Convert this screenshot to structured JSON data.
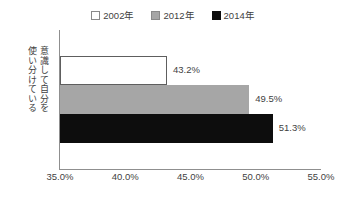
{
  "chart_data": {
    "type": "bar",
    "orientation": "horizontal",
    "title": "",
    "xlabel": "",
    "ylabel": "意識して自分を使い分けている",
    "categories": [
      "意識して自分を使い分けている"
    ],
    "series": [
      {
        "name": "2002年",
        "values": [
          43.2
        ],
        "value_labels": [
          "43.2%"
        ],
        "color": "#ffffff",
        "border_color": "#5e5e5e"
      },
      {
        "name": "2012年",
        "values": [
          49.5
        ],
        "value_labels": [
          "49.5%"
        ],
        "color": "#a6a6a6",
        "border_color": "#a6a6a6"
      },
      {
        "name": "2014年",
        "values": [
          51.3
        ],
        "value_labels": [
          "51.3%"
        ],
        "color": "#0d0d0d",
        "border_color": "#0d0d0d"
      }
    ],
    "xlim": [
      35.0,
      55.0
    ],
    "xticks": [
      35.0,
      40.0,
      45.0,
      50.0,
      55.0
    ],
    "xtick_labels": [
      "35.0%",
      "40.0%",
      "45.0%",
      "50.0%",
      "55.0%"
    ],
    "grid": false,
    "legend_position": "top-center"
  },
  "legend": {
    "items": [
      {
        "label": "2002年",
        "swatch": "legend-swatch-white"
      },
      {
        "label": "2012年",
        "swatch": "legend-swatch-gray"
      },
      {
        "label": "2014年",
        "swatch": "legend-swatch-black"
      }
    ]
  },
  "axis": {
    "y_label_column_right": "意識して自分を",
    "y_label_column_left": "使い分けている",
    "x_tick_labels": [
      "35.0%",
      "40.0%",
      "45.0%",
      "50.0%",
      "55.0%"
    ]
  },
  "bars": {
    "labels": [
      "43.2%",
      "49.5%",
      "51.3%"
    ]
  }
}
